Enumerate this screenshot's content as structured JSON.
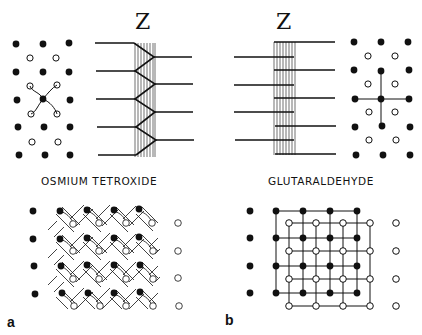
{
  "figure": {
    "panels": [
      {
        "id": "a",
        "panel_label": "a",
        "z_label": "Z",
        "caption": "OSMIUM TETROXIDE",
        "top_lattice": "filled and open dots with four curved arms from central dot (swastika-like link)",
        "z_line_pattern": "zig-zag cross-links at Z-line",
        "bottom_lattice": "basket-weave of filled and open filaments"
      },
      {
        "id": "b",
        "panel_label": "b",
        "z_label": "Z",
        "caption": "GLUTARALDEHYDE",
        "top_lattice": "filled and open dots with orthogonal straight cross-links from central dot",
        "z_line_pattern": "straight parallel links at Z-line",
        "bottom_lattice": "square lattice of filled and open filaments"
      }
    ],
    "colors": {
      "ink": "#111111",
      "background": "#ffffff"
    }
  }
}
